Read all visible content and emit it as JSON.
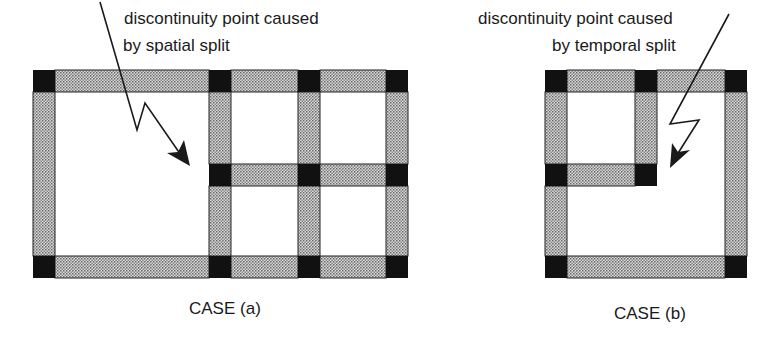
{
  "case_a": {
    "annotation_line1": "discontinuity point caused",
    "annotation_line2": "by spatial split",
    "caption": "CASE (a)"
  },
  "case_b": {
    "annotation_line1": "discontinuity point caused",
    "annotation_line2": "by temporal split",
    "caption": "CASE (b)"
  },
  "colors": {
    "edge_fill": "#b8b8b8",
    "node_fill": "#111111",
    "outline": "#222222"
  }
}
